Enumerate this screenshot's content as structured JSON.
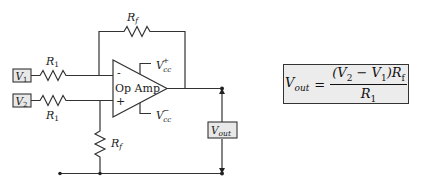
{
  "diagram": {
    "inputs": [
      {
        "label": "V",
        "sub": "1",
        "resistor": "R",
        "resistor_sub": "1"
      },
      {
        "label": "V",
        "sub": "2",
        "resistor": "R",
        "resistor_sub": "1"
      }
    ],
    "feedback_resistor": {
      "label": "R",
      "sub": "f"
    },
    "ground_resistor": {
      "label": "R",
      "sub": "f"
    },
    "op_amp": {
      "label": "Op Amp",
      "inverting": "-",
      "non_inverting": "+",
      "supply_pos": {
        "label": "V",
        "sub": "cc",
        "sup": "+"
      },
      "supply_neg": {
        "label": "V",
        "sub": "cc",
        "sup": "−"
      }
    },
    "output": {
      "label": "V",
      "sub": "out"
    },
    "colors": {
      "wire": "#333333",
      "box_fill": "#e8e8e8",
      "box_border": "#333333"
    }
  },
  "formula": {
    "lhs": "V",
    "lhs_sub": "out",
    "equals": "=",
    "numerator_open": "(V",
    "numerator_v2_sub": "2",
    "numerator_minus": " − V",
    "numerator_v1_sub": "1",
    "numerator_close": ")R",
    "numerator_rf_sub": "f",
    "denominator": "R",
    "denominator_sub": "1"
  }
}
